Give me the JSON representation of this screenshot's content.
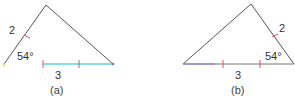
{
  "figures": [
    {
      "caption": "(a)",
      "side_label": "2",
      "base_label": "3",
      "angle_label": "54°",
      "colors": {
        "side": "#555555",
        "base": "#5fd3e0",
        "tick": "#e05050"
      }
    },
    {
      "caption": "(b)",
      "side_label": "2",
      "base_label": "3",
      "angle_label": "54°",
      "colors": {
        "side": "#555555",
        "base": "#777777",
        "tick": "#e05050"
      }
    }
  ]
}
